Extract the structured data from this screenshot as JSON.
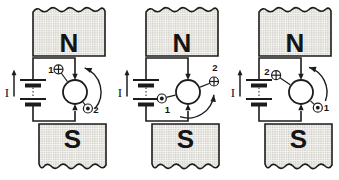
{
  "figure": {
    "kind": "dc-motor-commutation-diagram",
    "rotation_direction": "counterclockwise"
  },
  "colors": {
    "ink": "#1c1c1c",
    "background": "#ffffff",
    "magnet_fill": "#f3f2ee",
    "magnet_dots": "#a9a8a2",
    "rotor_fill": "#ffffff"
  },
  "panels": [
    {
      "labels": {
        "north": "N",
        "south": "S",
        "current": "I",
        "into_page": "1",
        "out_of_page": "2"
      },
      "into_page_position": "upper-left",
      "out_of_page_position": "lower-right",
      "rotation": "counterclockwise"
    },
    {
      "labels": {
        "north": "N",
        "south": "S",
        "current": "I",
        "into_page": "2",
        "out_of_page": "1"
      },
      "into_page_position": "right",
      "out_of_page_position": "left",
      "rotation": "counterclockwise"
    },
    {
      "labels": {
        "north": "N",
        "south": "S",
        "current": "I",
        "into_page": "2",
        "out_of_page": "1"
      },
      "into_page_position": "upper-left",
      "out_of_page_position": "lower-right",
      "rotation": "counterclockwise"
    }
  ]
}
